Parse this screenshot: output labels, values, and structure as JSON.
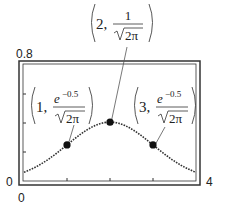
{
  "chart_data": {
    "type": "line",
    "title": "",
    "xlabel": "",
    "ylabel": "",
    "xlim": [
      0,
      4
    ],
    "ylim": [
      0,
      0.8
    ],
    "grid": false,
    "x_tick_labels": {
      "min": "0",
      "max": "4"
    },
    "y_tick_labels": {
      "min": "0",
      "max": "0.8"
    },
    "x_ticks": [
      1,
      2,
      3
    ],
    "y_ticks": [
      0.2,
      0.4,
      0.6
    ],
    "series": [
      {
        "name": "normal pdf (mean 2, sd 1)",
        "style": "dotted",
        "x": [
          0,
          0.25,
          0.5,
          0.75,
          1,
          1.25,
          1.5,
          1.75,
          2,
          2.25,
          2.5,
          2.75,
          3,
          3.25,
          3.5,
          3.75,
          4
        ],
        "y": [
          0.054,
          0.086,
          0.13,
          0.183,
          0.242,
          0.301,
          0.352,
          0.387,
          0.399,
          0.387,
          0.352,
          0.301,
          0.242,
          0.183,
          0.13,
          0.086,
          0.054
        ]
      }
    ],
    "points": [
      {
        "x": 1,
        "y": 0.242,
        "label_x": "1",
        "label_num": "e",
        "label_exp": "−0.5",
        "label_den": "2π"
      },
      {
        "x": 2,
        "y": 0.399,
        "label_x": "2",
        "label_num": "1",
        "label_exp": "",
        "label_den": "2π"
      },
      {
        "x": 3,
        "y": 0.242,
        "label_x": "3",
        "label_num": "e",
        "label_exp": "−0.5",
        "label_den": "2π"
      }
    ],
    "annotations": [
      "(1, e^-0.5/√(2π))",
      "(2, 1/√(2π))",
      "(3, e^-0.5/√(2π))"
    ]
  },
  "labels": {
    "y_max": "0.8",
    "y_min": "0",
    "x_min": "0",
    "x_max": "4",
    "p1_x": "1,",
    "p2_x": "2,",
    "p3_x": "3,",
    "p1_num": "e",
    "p1_exp": "−0.5",
    "p2_num": "1",
    "p3_num": "e",
    "p3_exp": "−0.5",
    "den": "2π"
  }
}
